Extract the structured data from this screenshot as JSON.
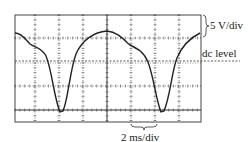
{
  "figure": {
    "type": "oscilloscope-trace",
    "vertical_scale_label": "5 V/div",
    "dc_level_label": "dc level",
    "horizontal_scale_label": "2 ms/div"
  },
  "grid": {
    "left": 15,
    "right": 201,
    "top": 15,
    "bottom": 122,
    "vertical_lines": [
      35,
      59,
      83,
      107,
      131,
      155,
      179
    ],
    "horizontal_lines": [
      38,
      86,
      110
    ],
    "dc_level_y": 61
  },
  "trace": {
    "path": "M15,33 C22,33 26,40 30,44 C36,48 42,48 46,56 C52,70 54,98 60,112 L63,111 C68,100 70,70 76,54 C82,40 94,32 107,31 C118,32 124,40 130,45 C138,49 144,52 148,62 C154,78 156,100 161,112 L164,111 C170,98 172,70 177,58 C182,46 190,38 200,33"
  },
  "colors": {
    "trace": "#222222",
    "grid": "#333333"
  }
}
